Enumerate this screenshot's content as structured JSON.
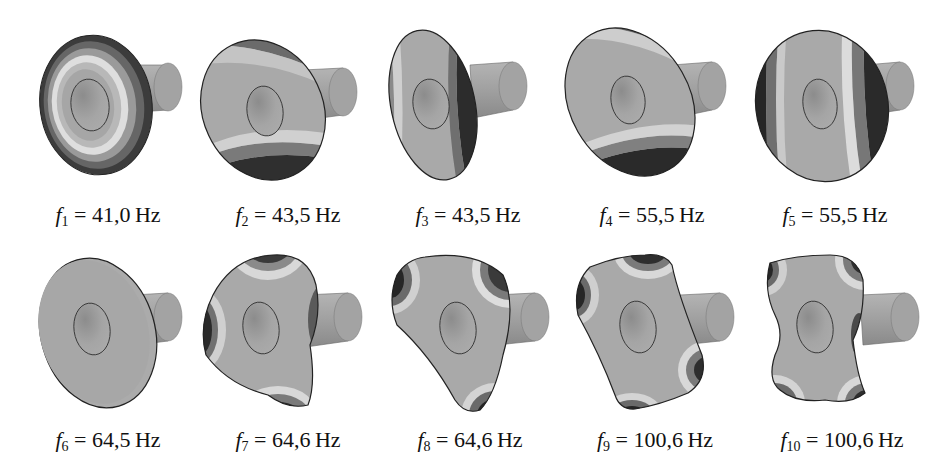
{
  "figure": {
    "unit": "Hz",
    "modes": [
      {
        "index": "1",
        "symbol": "f",
        "subscript": "1",
        "value": "41,0",
        "label": "f1 = 41,0 Hz",
        "shape": "axisymmetric-rings"
      },
      {
        "index": "2",
        "symbol": "f",
        "subscript": "2",
        "value": "43,5",
        "label": "f2 = 43,5 Hz",
        "shape": "tilt-vertical"
      },
      {
        "index": "3",
        "symbol": "f",
        "subscript": "3",
        "value": "43,5",
        "label": "f3 = 43,5 Hz",
        "shape": "tilt-horizontal"
      },
      {
        "index": "4",
        "symbol": "f",
        "subscript": "4",
        "value": "55,5",
        "label": "f4 = 55,5 Hz",
        "shape": "bending-top-bottom"
      },
      {
        "index": "5",
        "symbol": "f",
        "subscript": "5",
        "value": "55,5",
        "label": "f5 = 55,5 Hz",
        "shape": "bending-left-right"
      },
      {
        "index": "6",
        "symbol": "f",
        "subscript": "6",
        "value": "64,5",
        "label": "f6 = 64,5 Hz",
        "shape": "torsion-uniform"
      },
      {
        "index": "7",
        "symbol": "f",
        "subscript": "7",
        "value": "64,6",
        "label": "f7 = 64,6 Hz",
        "shape": "three-lobe"
      },
      {
        "index": "8",
        "symbol": "f",
        "subscript": "8",
        "value": "64,6",
        "label": "f8 = 64,6 Hz",
        "shape": "three-lobe-rotated"
      },
      {
        "index": "9",
        "symbol": "f",
        "subscript": "9",
        "value": "100,6",
        "label": "f9 = 100,6 Hz",
        "shape": "four-lobe"
      },
      {
        "index": "10",
        "symbol": "f",
        "subscript": "10",
        "value": "100,6",
        "label": "f10 = 100,6 Hz",
        "shape": "four-lobe-rotated"
      }
    ]
  },
  "colors": {
    "surface": "#a9a9a9",
    "shaft": "#9c9c9c",
    "light_band": "#d6d6d6",
    "mid_band": "#7d7d7d",
    "dark_band": "#3a3a3a",
    "edge": "#2a2a2a",
    "background": "#ffffff"
  }
}
